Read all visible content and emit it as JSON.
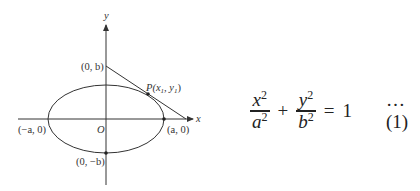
{
  "diagram": {
    "axes": {
      "x_label": "x",
      "y_label": "y"
    },
    "origin_label": "O",
    "points": {
      "top": "(0, b)",
      "left": "(−a, 0)",
      "right": "(a, 0)",
      "bottom": "(0, −b)",
      "tangent_point_prefix": "P(x",
      "tangent_point_sub1": "1",
      "tangent_point_mid": ", y",
      "tangent_point_sub2": "1",
      "tangent_point_suffix": ")"
    },
    "colors": {
      "stroke": "#333333",
      "background": "#ffffff"
    }
  },
  "equation": {
    "term1_num": "x",
    "term1_den": "a",
    "term2_num": "y",
    "term2_den": "b",
    "exponent": "2",
    "plus": "+",
    "equals": "=",
    "rhs": "1",
    "reference": "…(1)"
  }
}
